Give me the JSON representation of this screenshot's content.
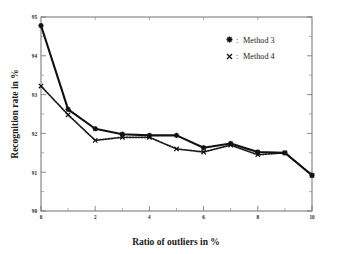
{
  "chart_data": {
    "type": "line",
    "title": "",
    "xlabel": "Ratio of outliers in %",
    "ylabel": "Recognition rate in %",
    "xlim": [
      0,
      10
    ],
    "ylim": [
      90,
      95
    ],
    "xticks": [
      0,
      2,
      4,
      6,
      8,
      10
    ],
    "xtick_labels": [
      "0",
      "2",
      "4",
      "6",
      "8",
      "10"
    ],
    "yticks": [
      90,
      91,
      92,
      93,
      94,
      95
    ],
    "ytick_labels": [
      "90",
      "91",
      "92",
      "93",
      "94",
      "95"
    ],
    "grid": false,
    "legend_position": "upper-right",
    "x": [
      0,
      1,
      2,
      3,
      4,
      5,
      6,
      7,
      8,
      9,
      10
    ],
    "series": [
      {
        "name": "Method 3",
        "marker": "star",
        "linestyle": "solid",
        "color": "#111111",
        "values": [
          94.78,
          92.62,
          92.12,
          91.98,
          91.95,
          91.95,
          91.63,
          91.74,
          91.52,
          91.5,
          90.92
        ]
      },
      {
        "name": "Method 4",
        "marker": "cross",
        "linestyle": "dotted",
        "color": "#1a1a1a",
        "values": [
          93.22,
          92.48,
          91.82,
          91.9,
          91.9,
          91.6,
          91.52,
          91.7,
          91.45,
          91.5,
          90.92
        ]
      }
    ],
    "legend": [
      {
        "symbol": "*",
        "separator": ":",
        "label": "Method 3"
      },
      {
        "symbol": "×",
        "separator": ":",
        "label": "Method 4"
      }
    ]
  },
  "figure": {
    "axis_color": "#7d7d7d",
    "ink_color": "#111111",
    "background": "#ffffff"
  }
}
